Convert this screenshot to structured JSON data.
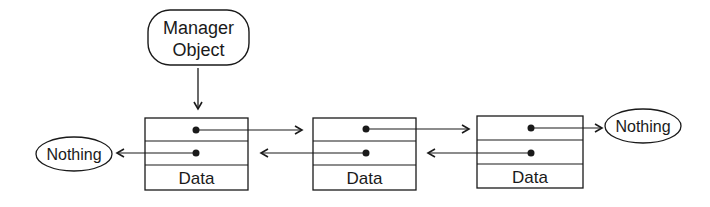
{
  "diagram": {
    "type": "doubly-linked-list",
    "manager": {
      "line1": "Manager",
      "line2": "Object"
    },
    "nodes": [
      {
        "label": "Data"
      },
      {
        "label": "Data"
      },
      {
        "label": "Data"
      }
    ],
    "terminals": {
      "left": "Nothing",
      "right": "Nothing"
    },
    "colors": {
      "stroke": "#1a1a1a",
      "background": "#ffffff"
    }
  }
}
